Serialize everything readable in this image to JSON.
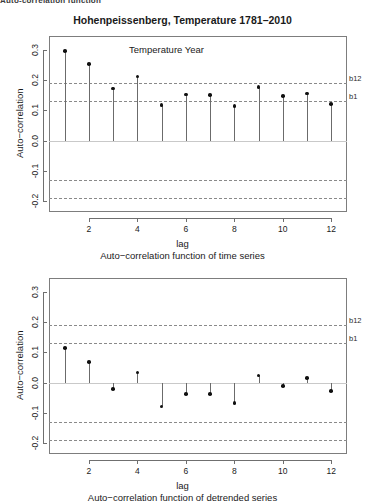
{
  "page": {
    "clipped_header": "Auto-correlation function",
    "background": "#ffffff",
    "point_color": "#101010",
    "band_color": "#8a8a8a"
  },
  "chart_data": [
    {
      "id": "acf-time-series",
      "type": "bar",
      "title": "Hohenpeissenberg, Temperature 1781–2010",
      "annotation": "Temperature Year",
      "xlabel": "lag",
      "ylabel": "Auto−correlation",
      "caption": "Auto−correlation function of time series",
      "categories": [
        1,
        2,
        3,
        4,
        5,
        6,
        7,
        8,
        9,
        10,
        11,
        12
      ],
      "values": [
        0.295,
        0.252,
        0.172,
        0.212,
        0.118,
        0.152,
        0.15,
        0.115,
        0.177,
        0.148,
        0.156,
        0.12
      ],
      "xticks": [
        2,
        4,
        6,
        8,
        10,
        12
      ],
      "yticks": [
        "0.3",
        "0.2",
        "0.1",
        "0.0",
        "-0.1",
        "-0.2"
      ],
      "ytick_values": [
        0.3,
        0.2,
        0.1,
        0.0,
        -0.1,
        -0.2
      ],
      "ylim": [
        -0.235,
        0.345
      ],
      "xlim": [
        0.35,
        12.65
      ],
      "bands": [
        {
          "label": "b12",
          "value": 0.19
        },
        {
          "label": "b1",
          "value": 0.13
        },
        {
          "label": "",
          "value": -0.13
        },
        {
          "label": "",
          "value": -0.19
        }
      ],
      "grid": false,
      "legend": "none"
    },
    {
      "id": "acf-detrended-series",
      "type": "bar",
      "title": "",
      "annotation": "",
      "xlabel": "lag",
      "ylabel": "Auto−correlation",
      "caption": "Auto−correlation function of detrended series",
      "categories": [
        1,
        2,
        3,
        4,
        5,
        6,
        7,
        8,
        9,
        10,
        11,
        12
      ],
      "values": [
        0.115,
        0.069,
        -0.021,
        0.033,
        -0.078,
        -0.038,
        -0.037,
        -0.066,
        0.024,
        -0.011,
        0.016,
        -0.027
      ],
      "xticks": [
        2,
        4,
        6,
        8,
        10,
        12
      ],
      "yticks": [
        "0.3",
        "0.2",
        "0.1",
        "0.0",
        "-0.1",
        "-0.2"
      ],
      "ytick_values": [
        0.3,
        0.2,
        0.1,
        0.0,
        -0.1,
        -0.2
      ],
      "ylim": [
        -0.235,
        0.345
      ],
      "xlim": [
        0.35,
        12.65
      ],
      "bands": [
        {
          "label": "b12",
          "value": 0.19
        },
        {
          "label": "b1",
          "value": 0.13
        },
        {
          "label": "",
          "value": -0.13
        },
        {
          "label": "",
          "value": -0.19
        }
      ],
      "grid": false,
      "legend": "none"
    }
  ]
}
